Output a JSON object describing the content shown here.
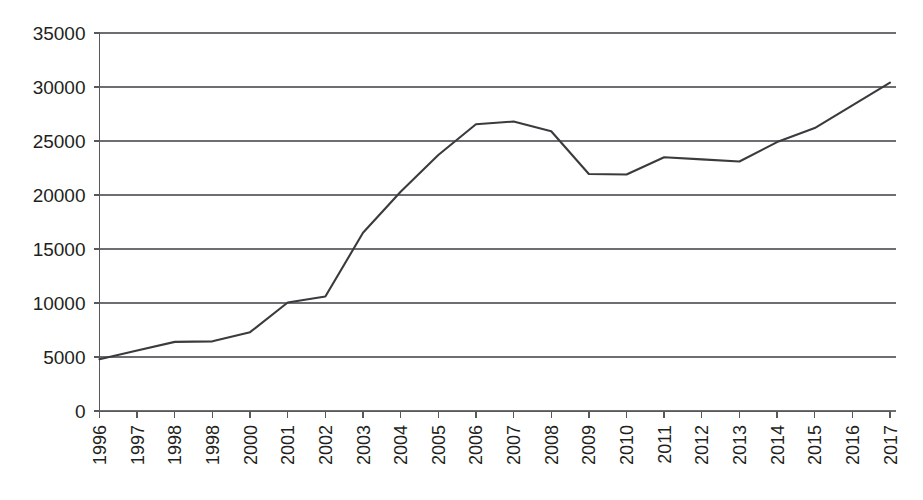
{
  "chart_data": {
    "type": "line",
    "title": "",
    "subtitle": "",
    "xlabel": "",
    "ylabel": "",
    "categories": [
      "1996",
      "1997",
      "1998",
      "1998",
      "2000",
      "2001",
      "2002",
      "2003",
      "2004",
      "2005",
      "2006",
      "2007",
      "2008",
      "2009",
      "2010",
      "2011",
      "2012",
      "2013",
      "2014",
      "2015",
      "2016",
      "2017"
    ],
    "series": [
      {
        "name": "series-1",
        "color": "#3b3b3d",
        "values": [
          4800,
          5600,
          6400,
          6450,
          7300,
          10050,
          10600,
          16500,
          20300,
          23700,
          26550,
          26800,
          25900,
          21950,
          21900,
          23500,
          23300,
          23100,
          24900,
          26200,
          28300,
          30400
        ]
      }
    ],
    "ylim": [
      0,
      35000
    ],
    "yticks": [
      0,
      5000,
      10000,
      15000,
      20000,
      25000,
      30000,
      35000
    ],
    "ytick_labels": [
      "0",
      "5000",
      "10000",
      "15000",
      "20000",
      "25000",
      "30000",
      "35000"
    ],
    "grid": true,
    "grid_axis": "y",
    "legend": false,
    "legend_position": "none",
    "markers": false,
    "xtick_rotation": -90,
    "background_color": "#ffffff",
    "gridline_color": "#6d6e71",
    "axis_color": "#58595b",
    "text_color": "#231f20"
  }
}
